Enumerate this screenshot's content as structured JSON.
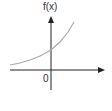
{
  "chart_data": {
    "type": "line",
    "title": "",
    "xlabel": "",
    "ylabel": "f(x)",
    "origin_label": "0",
    "x_tick_labels": [
      "0"
    ],
    "grid": false,
    "legend": null,
    "series": [
      {
        "name": "f(x)",
        "function": "exponential growth",
        "color": "#aaaaaa",
        "points_px": [
          [
            10,
            65
          ],
          [
            20,
            63
          ],
          [
            30,
            60
          ],
          [
            40,
            56
          ],
          [
            51,
            50
          ],
          [
            60,
            42
          ],
          [
            68,
            32
          ],
          [
            74,
            22
          ]
        ]
      }
    ],
    "axes": {
      "x_axis_color": "#222222",
      "y_axis_color": "#222222",
      "x_arrow": true,
      "y_arrow": true
    }
  },
  "labels": {
    "y_axis": "f(x)",
    "origin": "0"
  }
}
